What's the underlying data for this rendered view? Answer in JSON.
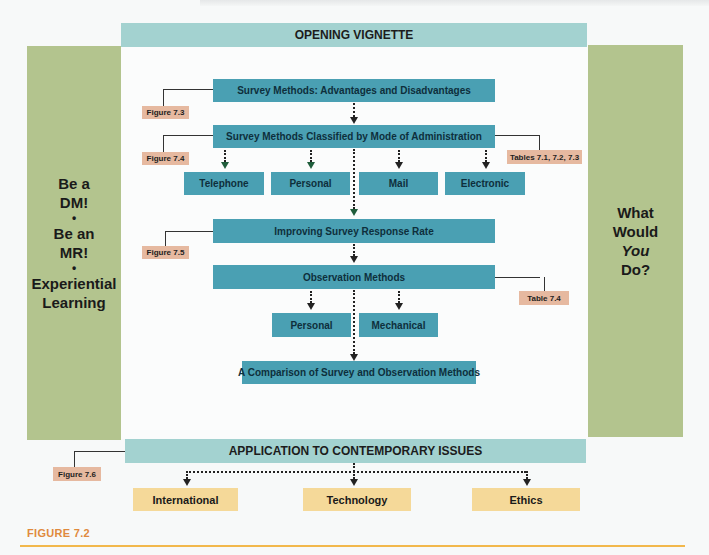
{
  "header": {
    "chapter_running_head": ""
  },
  "top_bar": {
    "label": "OPENING VIGNETTE"
  },
  "left_panel": {
    "lines": [
      "Be a",
      "DM!",
      "•",
      "Be an",
      "MR!",
      "•",
      "Experiential",
      "Learning"
    ]
  },
  "right_panel": {
    "line1": "What",
    "line2": "Would",
    "line3": "You",
    "line4": "Do?"
  },
  "flow": {
    "box1": "Survey Methods: Advantages and Disadvantages",
    "box2": "Survey Methods Classified by Mode of Administration",
    "modes": [
      "Telephone",
      "Personal",
      "Mail",
      "Electronic"
    ],
    "box3": "Improving Survey Response Rate",
    "box4": "Observation Methods",
    "observation_types": [
      "Personal",
      "Mechanical"
    ],
    "box5": "A Comparison of Survey and Observation Methods"
  },
  "badges": {
    "fig73": "Figure 7.3",
    "fig74": "Figure 7.4",
    "tables": "Tables 7.1, 7.2, 7.3",
    "fig75": "Figure 7.5",
    "table74": "Table 7.4",
    "fig76": "Figure 7.6"
  },
  "bottom_bar": {
    "label": "APPLICATION TO CONTEMPORARY ISSUES"
  },
  "issues": [
    "International",
    "Technology",
    "Ethics"
  ],
  "caption": {
    "label": "FIGURE 7.2"
  },
  "colors": {
    "teal_box": "#4aa0b3",
    "teal_light_bar": "#a3d2d0",
    "side_panel_green": "#b3c48e",
    "badge_salmon": "#e6b9a0",
    "issue_yellow": "#f5d999",
    "caption_orange": "#e08a3d",
    "rule_gold": "#f2b84c"
  }
}
